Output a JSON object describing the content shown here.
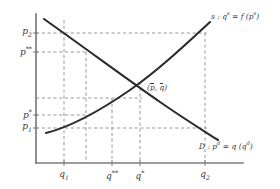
{
  "figure": {
    "type": "supply-demand-diagram",
    "background_color": "#ffffff",
    "axis_color": "#7d7d7d",
    "curve_color": "#2b2b2b",
    "dash_color": "#8c8c8c",
    "text_color": "#3a3a3a"
  },
  "axes": {
    "x_axis_label": "",
    "y_axis_label": "",
    "origin_px": {
      "x": 36,
      "y": 163
    },
    "x_end_px": 243,
    "y_end_px": 14
  },
  "price_ticks": [
    {
      "id": "p2",
      "base": "p",
      "sub": "2",
      "sup": "",
      "label": "p2",
      "y_px": 33
    },
    {
      "id": "pss",
      "base": "p",
      "sub": "",
      "sup": "**",
      "label": "p**",
      "y_px": 52
    },
    {
      "id": "pstar",
      "base": "p",
      "sub": "",
      "sup": "*",
      "label": "p*",
      "y_px": 115
    },
    {
      "id": "p1",
      "base": "p",
      "sub": "1",
      "sup": "",
      "label": "p1",
      "y_px": 128
    }
  ],
  "quantity_ticks": [
    {
      "id": "q1",
      "base": "q",
      "sub": "1",
      "sup": "",
      "label": "q1",
      "x_px": 64
    },
    {
      "id": "qss",
      "base": "q",
      "sub": "",
      "sup": "**",
      "label": "q**",
      "x_px": 112
    },
    {
      "id": "qstar",
      "base": "q",
      "sub": "",
      "sup": "*",
      "label": "q*",
      "x_px": 140
    },
    {
      "id": "q2",
      "base": "q",
      "sub": "2",
      "sup": "",
      "label": "q2",
      "x_px": 205
    }
  ],
  "curves": {
    "supply": {
      "name": "supply-curve",
      "label_text": "s : q",
      "label_sup1": "s",
      "label_mid": " = f (p",
      "label_sup2": "s",
      "label_end": ")",
      "label_full": "s : qˢ = f (pˢ)",
      "label_px": {
        "x": 211,
        "y": 11
      }
    },
    "demand": {
      "name": "demand-curve",
      "label_text": "D : p",
      "label_sup1": "d",
      "label_mid": " = q (q",
      "label_sup2": "d",
      "label_end": ")",
      "label_full": "D : pᵈ = q (qᵈ)",
      "label_px": {
        "x": 199,
        "y": 141
      }
    }
  },
  "equilibrium": {
    "name": "equilibrium-point",
    "label_open": "(",
    "label_p": "p",
    "label_comma": ", ",
    "label_q": "q",
    "label_close": ")",
    "label_full": "(p̄, q̄)",
    "point_px": {
      "x": 140,
      "y": 82
    },
    "label_px": {
      "x": 147,
      "y": 84
    }
  }
}
